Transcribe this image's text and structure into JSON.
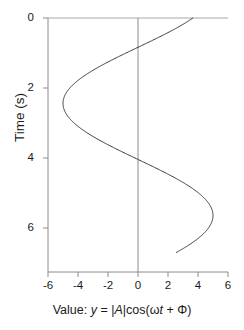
{
  "figure": {
    "background_color": "#ffffff",
    "line_color": "#3a3a3a",
    "axis_color": "#8c8c8c",
    "text_color": "#1a1a1a"
  },
  "axis_labels": {
    "x_prefix": "Value: ",
    "x_var": "y",
    "x_eq": " = |",
    "x_amp": "A",
    "x_func": "|cos(ω",
    "x_t": "t",
    "x_tail": " + Φ)",
    "x_full": "Value: y = |A|cos(ωt + Φ)",
    "y_full": "Time (s)"
  },
  "chart_data": {
    "type": "line",
    "title": "",
    "subtitle": "",
    "xlabel": "Value: y = |A|cos(ωt + Φ)",
    "ylabel": "Time (s)",
    "orientation": "vertical-time-axis",
    "xlim": [
      -6,
      6
    ],
    "ylim": [
      0,
      7.26
    ],
    "y_inverted": true,
    "grid": false,
    "legend": null,
    "xticks": [
      -6,
      -4,
      -2,
      0,
      2,
      4,
      6
    ],
    "xtick_labels": [
      "-6",
      "-4",
      "-2",
      "0",
      "2",
      "4",
      "6"
    ],
    "yticks": [
      0,
      2,
      4,
      6
    ],
    "ytick_labels": [
      "0",
      "2",
      "4",
      "6"
    ],
    "zero_reference_line": {
      "axis": "x",
      "value": 0
    },
    "annotations": [],
    "series": [
      {
        "name": "y = |A|cos(ωt + Φ)",
        "amplitude": 5,
        "omega": 0.98,
        "phase": 0.75,
        "t": [
          0.0,
          0.2,
          0.4,
          0.6,
          0.8,
          1.0,
          1.2,
          1.4,
          1.6,
          1.8,
          2.0,
          2.2,
          2.4,
          2.6,
          2.8,
          3.0,
          3.2,
          3.4,
          3.6,
          3.8,
          4.0,
          4.2,
          4.4,
          4.6,
          4.8,
          5.0,
          5.2,
          5.4,
          5.6,
          5.8,
          6.0,
          6.2,
          6.4,
          6.6,
          6.7
        ],
        "values": [
          3.66,
          2.82,
          1.88,
          0.87,
          -0.16,
          -1.19,
          -2.17,
          -3.06,
          -3.83,
          -4.44,
          -4.86,
          -4.99,
          -4.93,
          -4.65,
          -4.16,
          -3.5,
          -2.69,
          -1.76,
          -0.76,
          0.27,
          1.3,
          2.28,
          3.17,
          3.91,
          4.5,
          4.87,
          5.0,
          4.9,
          4.57,
          4.04,
          3.34,
          2.5,
          1.57,
          0.57,
          0.05
        ]
      }
    ]
  },
  "geometry": {
    "plot_left_px": 48,
    "plot_right_px": 228,
    "plot_top_px": 18,
    "plot_bottom_px": 272,
    "zero_x_px": 138
  }
}
